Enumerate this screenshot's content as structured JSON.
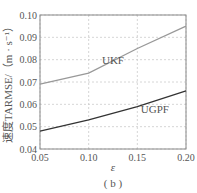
{
  "chart_data": {
    "type": "line",
    "title": "",
    "caption": "( b )",
    "xlabel": "ε",
    "ylabel": "速度TARMSE/（m · s⁻¹）",
    "xlim": [
      0.05,
      0.2
    ],
    "ylim": [
      0.04,
      0.1
    ],
    "x": [
      0.05,
      0.1,
      0.15,
      0.2
    ],
    "xticks": [
      "0.05",
      "0.10",
      "0.15",
      "0.20"
    ],
    "yticks": [
      "0.04",
      "0.05",
      "0.06",
      "0.07",
      "0.08",
      "0.09",
      "0.10"
    ],
    "grid": true,
    "series": [
      {
        "name": "UKF",
        "values": [
          0.069,
          0.074,
          0.085,
          0.095
        ],
        "color": "#999999",
        "label_pos": [
          0.125,
          0.078
        ]
      },
      {
        "name": "UGPF",
        "values": [
          0.048,
          0.053,
          0.059,
          0.066
        ],
        "color": "#333333",
        "label_pos": [
          0.168,
          0.056
        ]
      }
    ]
  }
}
